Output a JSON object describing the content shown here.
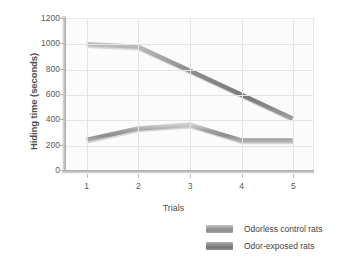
{
  "chart_data": {
    "type": "line",
    "title": "",
    "xlabel": "Trials",
    "ylabel": "Hiding time (seconds)",
    "categories": [
      "1",
      "2",
      "3",
      "4",
      "5"
    ],
    "x": [
      1,
      2,
      3,
      4,
      5
    ],
    "xlim": [
      0.6,
      5.4
    ],
    "ylim": [
      0,
      1200
    ],
    "yticks": [
      0,
      200,
      400,
      600,
      800,
      1000,
      1200
    ],
    "ytick_labels": [
      "0",
      "200",
      "400",
      "600",
      "800",
      "1000",
      "1200"
    ],
    "xtick_labels": [
      "1",
      "2",
      "3",
      "4",
      "5"
    ],
    "grid": true,
    "legend_position": "below-right",
    "series": [
      {
        "name": "Odor-exposed rats",
        "color": "#8b8b8b",
        "values": [
          1000,
          980,
          790,
          600,
          410
        ]
      },
      {
        "name": "Odorless control rats",
        "color": "#9b9b9b",
        "values": [
          240,
          330,
          360,
          235,
          235
        ]
      }
    ]
  },
  "legend": {
    "items": [
      {
        "label": "Odorless control rats",
        "swatch": "series-a"
      },
      {
        "label": "Odor-exposed rats",
        "swatch": "series-b"
      }
    ]
  }
}
